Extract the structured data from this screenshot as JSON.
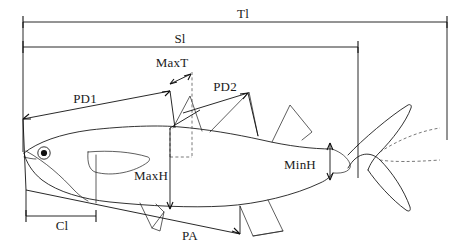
{
  "diagram": {
    "background_color": "#ffffff",
    "line_color": "#1c1c1c",
    "dashed_line_color": "#555555",
    "labels": {
      "total_length": "Tl",
      "standard_length": "Sl",
      "max_thickness": "MaxT",
      "predorsal_1": "PD1",
      "predorsal_2": "PD2",
      "max_height": "MaxH",
      "min_height": "MinH",
      "cephalic_length": "Cl",
      "preanal": "PA"
    },
    "measurements": [
      {
        "id": "Tl",
        "label": "Tl",
        "label_x": 243,
        "label_y": 18,
        "orientation": "horizontal",
        "span": "snout tip to caudal fin tip"
      },
      {
        "id": "Sl",
        "label": "Sl",
        "label_x": 180,
        "label_y": 43,
        "orientation": "horizontal",
        "span": "snout tip to caudal peduncle end"
      },
      {
        "id": "MaxT",
        "label": "MaxT",
        "label_x": 148,
        "label_y": 67,
        "orientation": "oblique",
        "span": "maximum thickness"
      },
      {
        "id": "PD1",
        "label": "PD1",
        "label_x": 62,
        "label_y": 100,
        "orientation": "oblique",
        "span": "snout to first dorsal fin origin"
      },
      {
        "id": "PD2",
        "label": "PD2",
        "label_x": 209,
        "label_y": 89,
        "orientation": "oblique",
        "span": "snout to second dorsal fin origin"
      },
      {
        "id": "MaxH",
        "label": "MaxH",
        "label_x": 128,
        "label_y": 178,
        "orientation": "vertical",
        "span": "maximum body height"
      },
      {
        "id": "MinH",
        "label": "MinH",
        "label_x": 277,
        "label_y": 169,
        "orientation": "vertical",
        "span": "minimum body height at caudal peduncle"
      },
      {
        "id": "Cl",
        "label": "Cl",
        "label_x": 56,
        "label_y": 226,
        "orientation": "horizontal",
        "span": "cephalic (head) length"
      },
      {
        "id": "PA",
        "label": "PA",
        "label_x": 176,
        "label_y": 238,
        "orientation": "oblique",
        "span": "snout to anal fin origin"
      }
    ]
  }
}
